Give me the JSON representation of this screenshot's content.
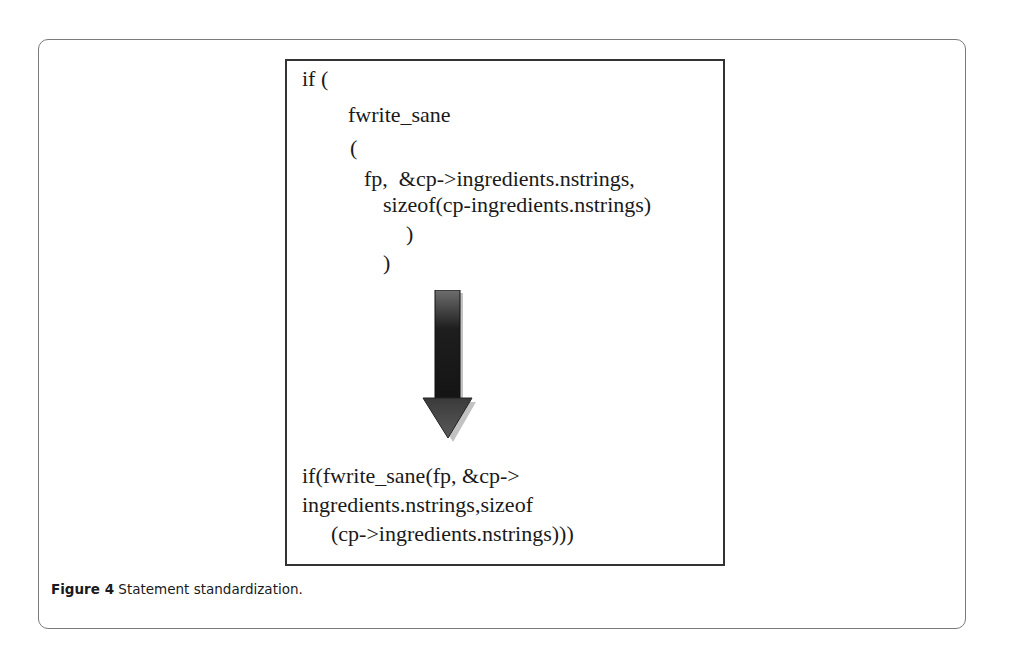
{
  "figure": {
    "before_code": [
      {
        "text": "if (",
        "x": 302,
        "y": 66
      },
      {
        "text": "fwrite_sane",
        "x": 348,
        "y": 102
      },
      {
        "text": "(",
        "x": 350,
        "y": 135
      },
      {
        "text": "fp,  &cp->ingredients.nstrings,",
        "x": 364,
        "y": 166
      },
      {
        "text": "sizeof(cp-ingredients.nstrings)",
        "x": 383,
        "y": 192
      },
      {
        "text": ")",
        "x": 406,
        "y": 221
      },
      {
        "text": ")",
        "x": 383,
        "y": 250
      }
    ],
    "after_code": [
      {
        "text": "if(fwrite_sane(fp, &cp->",
        "x": 302,
        "y": 463
      },
      {
        "text": "ingredients.nstrings,sizeof",
        "x": 302,
        "y": 492
      },
      {
        "text": "(cp->ingredients.nstrings)))",
        "x": 331,
        "y": 521
      }
    ],
    "arrow": {
      "direction": "down",
      "color_top": "#7a7a7a",
      "color_mid": "#1e1e1e",
      "shadow": "#9a9a9a"
    }
  },
  "caption": {
    "label": "Figure 4",
    "text": " Statement standardization."
  }
}
